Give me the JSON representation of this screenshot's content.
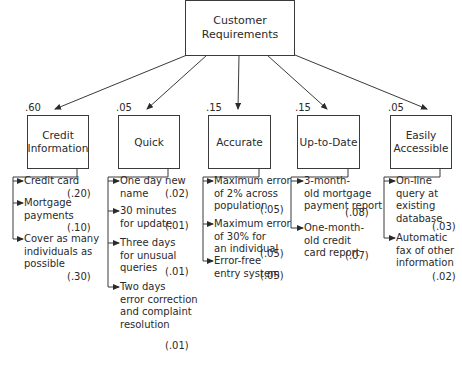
{
  "root": {
    "label": "Customer\nRequirements"
  },
  "categories": [
    {
      "label": "Credit\nInformation",
      "weight": ".60",
      "items": [
        {
          "text": "Credit card",
          "score": "(.20)"
        },
        {
          "text": "Mortgage\npayments",
          "score": "(.10)"
        },
        {
          "text": "Cover as many\nindividuals as\npossible",
          "score": "(.30)"
        }
      ]
    },
    {
      "label": "Quick",
      "weight": ".05",
      "items": [
        {
          "text": "One day new\nname",
          "score": "(.02)"
        },
        {
          "text": "30 minutes\nfor update",
          "score": "(.01)"
        },
        {
          "text": "Three days\nfor unusual\nqueries",
          "score": "(.01)"
        },
        {
          "text": "Two days\nerror correction\nand complaint\nresolution",
          "score": "(.01)"
        }
      ]
    },
    {
      "label": "Accurate",
      "weight": ".15",
      "items": [
        {
          "text": "Maximum error\nof 2% across\npopulation",
          "score": "(.05)"
        },
        {
          "text": "Maximum error\nof 30% for\nan individual",
          "score": "(.05)"
        },
        {
          "text": "Error-free\nentry system",
          "score": "(.05)"
        }
      ]
    },
    {
      "label": "Up-to-Date",
      "weight": ".15",
      "items": [
        {
          "text": "3-month-\nold mortgage\npayment report",
          "score": "(.08)"
        },
        {
          "text": "One-month-\nold credit\ncard report",
          "score": "(.07)"
        }
      ]
    },
    {
      "label": "Easily\nAccessible",
      "weight": ".05",
      "items": [
        {
          "text": "On-line\nquery at\nexisting\ndatabase",
          "score": "(.03)"
        },
        {
          "text": "Automatic\nfax of other\ninformation",
          "score": "(.02)"
        }
      ]
    }
  ]
}
